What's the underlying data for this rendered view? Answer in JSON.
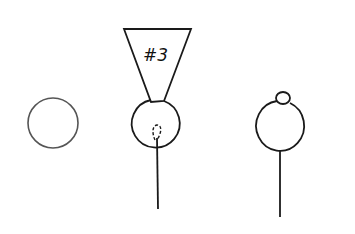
{
  "diagram": {
    "figures": [
      {
        "id": "plain-circle",
        "description": "empty circle"
      },
      {
        "id": "circle-with-funnel",
        "label": "#3",
        "description": "circle with funnel labeled #3 on top, dashed inner loop, stem below"
      },
      {
        "id": "circle-with-bump",
        "description": "circle with small bump on top and stem below"
      }
    ],
    "funnel_label": "#3",
    "colors": {
      "stroke": "#1a1a1a",
      "light_stroke": "#555555",
      "background": "#ffffff"
    }
  }
}
